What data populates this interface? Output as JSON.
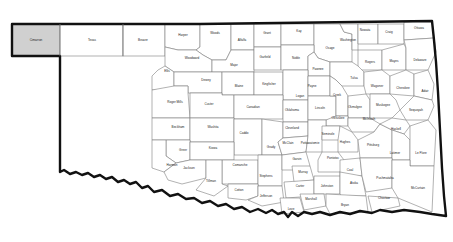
{
  "map": {
    "title": "Oklahoma County Map",
    "region": "Oklahoma",
    "county_count": 77,
    "background_color": "#ffffff",
    "county_fill": "#ffffff",
    "county_border_color": "#7d7d7d",
    "state_outline_color": "#111111",
    "highlight_fill": "#d0d0d0",
    "label_color": "#1a1a1a",
    "highlighted_counties": [
      "Cimarron"
    ],
    "counties": [
      {
        "name": "Cimarron",
        "x": 36,
        "y": 40,
        "highlight": true
      },
      {
        "name": "Texas",
        "x": 92,
        "y": 40,
        "highlight": false
      },
      {
        "name": "Beaver",
        "x": 143,
        "y": 40,
        "highlight": false
      },
      {
        "name": "Harper",
        "x": 183,
        "y": 35,
        "highlight": false
      },
      {
        "name": "Woods",
        "x": 215,
        "y": 33,
        "highlight": false
      },
      {
        "name": "Alfalfa",
        "x": 242,
        "y": 40,
        "highlight": false
      },
      {
        "name": "Grant",
        "x": 267,
        "y": 33,
        "highlight": false
      },
      {
        "name": "Kay",
        "x": 299,
        "y": 31,
        "highlight": false
      },
      {
        "name": "Nowata",
        "x": 365,
        "y": 30,
        "highlight": false
      },
      {
        "name": "Craig",
        "x": 389,
        "y": 32,
        "highlight": false
      },
      {
        "name": "Ottawa",
        "x": 419,
        "y": 28,
        "highlight": false
      },
      {
        "name": "Washington",
        "x": 348,
        "y": 40,
        "highlight": false
      },
      {
        "name": "Osage",
        "x": 330,
        "y": 48,
        "highlight": false
      },
      {
        "name": "Woodward",
        "x": 192,
        "y": 58,
        "highlight": false
      },
      {
        "name": "Garfield",
        "x": 265,
        "y": 57,
        "highlight": false
      },
      {
        "name": "Noble",
        "x": 296,
        "y": 58,
        "highlight": false
      },
      {
        "name": "Major",
        "x": 234,
        "y": 65,
        "highlight": false
      },
      {
        "name": "Rogers",
        "x": 370,
        "y": 62,
        "highlight": false
      },
      {
        "name": "Mayes",
        "x": 394,
        "y": 61,
        "highlight": false
      },
      {
        "name": "Delaware",
        "x": 420,
        "y": 60,
        "highlight": false
      },
      {
        "name": "Ellis",
        "x": 167,
        "y": 71,
        "highlight": false
      },
      {
        "name": "Pawnee",
        "x": 318,
        "y": 69,
        "highlight": false
      },
      {
        "name": "Dewey",
        "x": 206,
        "y": 80,
        "highlight": false
      },
      {
        "name": "Blaine",
        "x": 239,
        "y": 86,
        "highlight": false
      },
      {
        "name": "Kingfisher",
        "x": 269,
        "y": 84,
        "highlight": false
      },
      {
        "name": "Payne",
        "x": 312,
        "y": 86,
        "highlight": false
      },
      {
        "name": "Tulsa",
        "x": 354,
        "y": 78,
        "highlight": false
      },
      {
        "name": "Logan",
        "x": 300,
        "y": 96,
        "highlight": false
      },
      {
        "name": "Creek",
        "x": 337,
        "y": 95,
        "highlight": false
      },
      {
        "name": "Wagoner",
        "x": 377,
        "y": 86,
        "highlight": false
      },
      {
        "name": "Cherokee",
        "x": 403,
        "y": 88,
        "highlight": false
      },
      {
        "name": "Adair",
        "x": 425,
        "y": 91,
        "highlight": false
      },
      {
        "name": "Roger Mills",
        "x": 175,
        "y": 102,
        "highlight": false
      },
      {
        "name": "Custer",
        "x": 209,
        "y": 104,
        "highlight": false
      },
      {
        "name": "Canadian",
        "x": 253,
        "y": 107,
        "highlight": false
      },
      {
        "name": "Oklahoma",
        "x": 292,
        "y": 110,
        "highlight": false
      },
      {
        "name": "Lincoln",
        "x": 320,
        "y": 108,
        "highlight": false
      },
      {
        "name": "Okmulgee",
        "x": 355,
        "y": 107,
        "highlight": false
      },
      {
        "name": "Muskogee",
        "x": 383,
        "y": 105,
        "highlight": false
      },
      {
        "name": "Sequoyah",
        "x": 416,
        "y": 110,
        "highlight": false
      },
      {
        "name": "Okfuskee",
        "x": 338,
        "y": 118,
        "highlight": false
      },
      {
        "name": "McIntosh",
        "x": 369,
        "y": 119,
        "highlight": false
      },
      {
        "name": "Beckham",
        "x": 178,
        "y": 127,
        "highlight": false
      },
      {
        "name": "Washita",
        "x": 213,
        "y": 127,
        "highlight": false
      },
      {
        "name": "Caddo",
        "x": 244,
        "y": 133,
        "highlight": false
      },
      {
        "name": "Cleveland",
        "x": 292,
        "y": 128,
        "highlight": false
      },
      {
        "name": "Seminole",
        "x": 328,
        "y": 134,
        "highlight": false
      },
      {
        "name": "McIntosh2",
        "x": 369,
        "y": 119,
        "highlight": false
      },
      {
        "name": "Haskell",
        "x": 396,
        "y": 129,
        "highlight": false
      },
      {
        "name": "Pottawatomie",
        "x": 310,
        "y": 143,
        "highlight": false
      },
      {
        "name": "Hughes",
        "x": 345,
        "y": 142,
        "highlight": false
      },
      {
        "name": "Grady",
        "x": 271,
        "y": 147,
        "highlight": false
      },
      {
        "name": "McClain",
        "x": 288,
        "y": 143,
        "highlight": false
      },
      {
        "name": "Greer",
        "x": 183,
        "y": 150,
        "highlight": false
      },
      {
        "name": "Kiowa",
        "x": 213,
        "y": 148,
        "highlight": false
      },
      {
        "name": "Pittsburg",
        "x": 373,
        "y": 145,
        "highlight": false
      },
      {
        "name": "Latimer",
        "x": 395,
        "y": 153,
        "highlight": false
      },
      {
        "name": "Le Flore",
        "x": 421,
        "y": 153,
        "highlight": false
      },
      {
        "name": "Harmon",
        "x": 172,
        "y": 165,
        "highlight": false
      },
      {
        "name": "Jackson",
        "x": 189,
        "y": 168,
        "highlight": false
      },
      {
        "name": "Comanche",
        "x": 240,
        "y": 165,
        "highlight": false
      },
      {
        "name": "Garvin",
        "x": 297,
        "y": 159,
        "highlight": false
      },
      {
        "name": "Pontotoc",
        "x": 333,
        "y": 158,
        "highlight": false
      },
      {
        "name": "Murray",
        "x": 303,
        "y": 172,
        "highlight": false
      },
      {
        "name": "Coal",
        "x": 350,
        "y": 170,
        "highlight": false
      },
      {
        "name": "Tillman",
        "x": 211,
        "y": 181,
        "highlight": false
      },
      {
        "name": "Stephens",
        "x": 266,
        "y": 176,
        "highlight": false
      },
      {
        "name": "Cotton",
        "x": 239,
        "y": 190,
        "highlight": false
      },
      {
        "name": "Carter",
        "x": 300,
        "y": 186,
        "highlight": false
      },
      {
        "name": "Johnston",
        "x": 327,
        "y": 186,
        "highlight": false
      },
      {
        "name": "Atoka",
        "x": 354,
        "y": 183,
        "highlight": false
      },
      {
        "name": "Pushmataha",
        "x": 385,
        "y": 178,
        "highlight": false
      },
      {
        "name": "McCurtain",
        "x": 418,
        "y": 188,
        "highlight": false
      },
      {
        "name": "Jefferson",
        "x": 266,
        "y": 196,
        "highlight": false
      },
      {
        "name": "Marshall",
        "x": 311,
        "y": 199,
        "highlight": false
      },
      {
        "name": "Choctaw",
        "x": 384,
        "y": 198,
        "highlight": false
      },
      {
        "name": "Love",
        "x": 291,
        "y": 209,
        "highlight": false
      },
      {
        "name": "Bryan",
        "x": 345,
        "y": 205,
        "highlight": false
      }
    ]
  }
}
